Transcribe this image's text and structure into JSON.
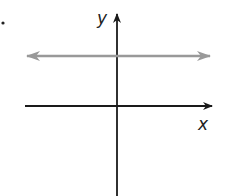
{
  "diagram": {
    "type": "coordinate-plane",
    "axes": {
      "x_label": "x",
      "y_label": "y"
    },
    "lines": [
      {
        "name": "horizontal-line",
        "description": "horizontal line above x-axis with arrows both ends",
        "color": "#999999"
      }
    ],
    "colors": {
      "axis": "#1a1a1a",
      "line": "#999999"
    },
    "marker": "•"
  }
}
